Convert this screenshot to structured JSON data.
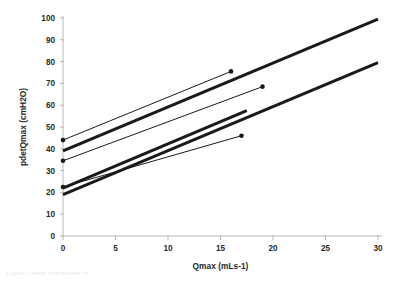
{
  "figure": {
    "caption_fragment": "Figure    Linear regression of ..."
  },
  "chart_data": {
    "type": "line",
    "title": "",
    "xlabel": "Qmax (mLs-1)",
    "ylabel": "pdetQmax (cmH2O)",
    "xlim": [
      0,
      30
    ],
    "ylim": [
      0,
      100
    ],
    "xticks": [
      0,
      5,
      10,
      15,
      20,
      25,
      30
    ],
    "yticks": [
      0,
      10,
      20,
      30,
      40,
      50,
      60,
      70,
      80,
      90,
      100
    ],
    "xtick_labels": [
      "0",
      "5",
      "10",
      "15",
      "20",
      "25",
      "30"
    ],
    "ytick_labels": [
      "0",
      "10",
      "20",
      "30",
      "40",
      "50",
      "60",
      "70",
      "80",
      "90",
      "100"
    ],
    "grid": false,
    "legend": null,
    "line_color": "#1a1a1a",
    "axis_color": "#b8b8b8",
    "series": [
      {
        "name": "thin-line-1",
        "style": "thin",
        "width": 1.0,
        "marker": "filled-circle",
        "markers_at": [
          "start",
          "end"
        ],
        "x": [
          0,
          16
        ],
        "y": [
          44.0,
          75.5
        ]
      },
      {
        "name": "thin-line-2",
        "style": "thin",
        "width": 1.0,
        "marker": "filled-circle",
        "markers_at": [
          "start",
          "end"
        ],
        "x": [
          0,
          19
        ],
        "y": [
          34.5,
          68.5
        ]
      },
      {
        "name": "thin-line-3",
        "style": "thin",
        "width": 1.0,
        "marker": "filled-circle",
        "markers_at": [
          "start",
          "end"
        ],
        "x": [
          0,
          17
        ],
        "y": [
          22.5,
          46.0
        ]
      },
      {
        "name": "thick-line-1",
        "style": "thick",
        "width": 3.0,
        "marker": "none",
        "markers_at": [],
        "x": [
          0,
          30
        ],
        "y": [
          39.0,
          99.5
        ]
      },
      {
        "name": "thick-line-2",
        "style": "thick",
        "width": 3.0,
        "marker": "none",
        "markers_at": [],
        "x": [
          0,
          30
        ],
        "y": [
          19.0,
          79.5
        ]
      },
      {
        "name": "thick-line-3",
        "style": "thick",
        "width": 3.0,
        "marker": "none",
        "markers_at": [],
        "x": [
          0,
          17.5
        ],
        "y": [
          22.0,
          57.5
        ]
      }
    ]
  }
}
